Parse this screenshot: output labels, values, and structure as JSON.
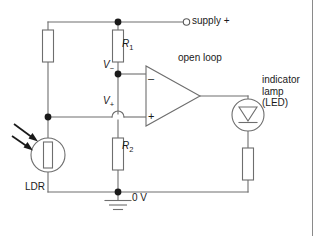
{
  "figure": {
    "background_color": "#ffffff",
    "wire_color": "#6e6e6e",
    "text_color": "#1a1a1a",
    "node_color": "#1a1a1a"
  },
  "labels": {
    "supply": "supply +",
    "open_loop": "open loop",
    "r1": "R",
    "r1_sub": "1",
    "r2": "R",
    "r2_sub": "2",
    "v_minus": "V",
    "v_minus_sub": "−",
    "v_plus": "V",
    "v_plus_sub": "+",
    "indicator_line1": "indicator",
    "indicator_line2": "lamp",
    "indicator_line3": "(LED)",
    "ldr": "LDR",
    "ground": "0 V",
    "opamp_minus_sign": "–",
    "opamp_plus_sign": "+"
  },
  "components": {
    "ldr": {
      "name": "light-dependent-resistor",
      "label": "LDR",
      "has_light_arrows": true,
      "arrow_count": 2
    },
    "r1": {
      "name": "resistor",
      "label": "R1"
    },
    "r2": {
      "name": "resistor",
      "label": "R2"
    },
    "r_left": {
      "name": "resistor",
      "label": ""
    },
    "r_led_series": {
      "name": "resistor",
      "label": ""
    },
    "opamp": {
      "name": "operational-amplifier",
      "mode": "open loop",
      "inverting_input": "V−",
      "noninverting_input": "V+"
    },
    "led": {
      "name": "light-emitting-diode",
      "label": "indicator lamp (LED)"
    },
    "supply_terminal": {
      "name": "supply-positive-terminal",
      "label": "supply +"
    },
    "ground_symbol": {
      "name": "ground-symbol",
      "label": "0 V"
    }
  }
}
